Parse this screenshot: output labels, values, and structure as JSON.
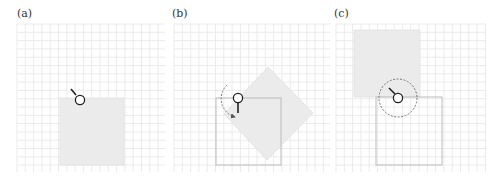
{
  "figure": {
    "width": 499,
    "height": 180,
    "colors": {
      "grid": "#e6e6e6",
      "fill": "#ebebeb",
      "outline": "#bcbcbc",
      "stroke": "#333333",
      "dashed": "#777777"
    },
    "panels": [
      {
        "id": "a",
        "label": "(a)",
        "label_pos": [
          17,
          17
        ],
        "grid": {
          "x0": 17,
          "y0": 24,
          "x1": 165,
          "y1": 172,
          "step": 8.3
        },
        "description": "Filled square with pivot circle at top edge; short handle pointing upper-left"
      },
      {
        "id": "b",
        "label": "(b)",
        "label_pos": [
          172,
          17
        ],
        "grid": {
          "x0": 174,
          "y0": 24,
          "x1": 330,
          "y1": 172,
          "step": 8.3
        },
        "description": "Original square outlined; filled square rotated 45° about pivot; dashed arc arrow showing rotation; handle pointing down"
      },
      {
        "id": "c",
        "label": "(c)",
        "label_pos": [
          334,
          17
        ],
        "grid": {
          "x0": 336,
          "y0": 24,
          "x1": 486,
          "y1": 172,
          "step": 8.3
        },
        "description": "Original square outlined; filled square translated up-left; dashed circle around pivot; handle pointing upper-left"
      }
    ]
  }
}
